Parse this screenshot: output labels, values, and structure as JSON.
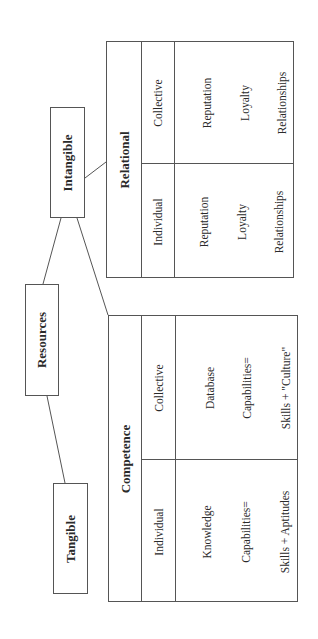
{
  "diagram": {
    "root": "Resources",
    "tangible": "Tangible",
    "intangible": "Intangible",
    "relational": {
      "title": "Relational",
      "individual": {
        "label": "Individual",
        "items": [
          "Reputation",
          "Loyalty",
          "Relationships"
        ]
      },
      "collective": {
        "label": "Collective",
        "items": [
          "Reputation",
          "Loyalty",
          "Relationships"
        ]
      }
    },
    "competence": {
      "title": "Competence",
      "individual": {
        "label": "Individual",
        "items": [
          "Knowledge",
          "Capabilities=",
          "Skills + Aptitudes"
        ]
      },
      "collective": {
        "label": "Collective",
        "items": [
          "Database",
          "Capabilities=",
          "Skills + \"Culture\""
        ]
      }
    }
  }
}
